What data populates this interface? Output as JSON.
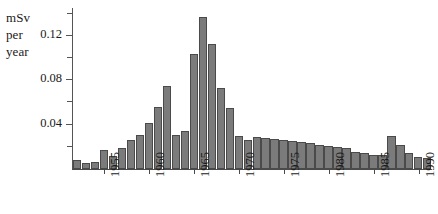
{
  "chart_data": {
    "type": "bar",
    "title": "",
    "subtitle": "",
    "xlabel": "",
    "ylabel": "mSv per year",
    "ylabel_lines": [
      "mSv",
      "per",
      "year"
    ],
    "ylim": [
      0,
      0.145
    ],
    "xlim": [
      1951.5,
      1991.5
    ],
    "grid": false,
    "legend": null,
    "bar_color": "#7b7b7b",
    "bar_edge_color": "#4a4a4a",
    "axis_color": "#4a4a4a",
    "y_ticks_major": [
      0.04,
      0.08,
      0.12
    ],
    "y_tick_labels": [
      "0.04",
      "0.08",
      "0.12"
    ],
    "y_ticks_minor": [
      0.02,
      0.06,
      0.1,
      0.14
    ],
    "x_ticks": [
      1955,
      1960,
      1965,
      1970,
      1975,
      1980,
      1985,
      1990
    ],
    "x_tick_labels": [
      "1955",
      "1960",
      "1965",
      "1970",
      "1975",
      "1980",
      "1985",
      "1990"
    ],
    "categories": [
      1952,
      1953,
      1954,
      1955,
      1956,
      1957,
      1958,
      1959,
      1960,
      1961,
      1962,
      1963,
      1964,
      1965,
      1966,
      1967,
      1968,
      1969,
      1970,
      1971,
      1972,
      1973,
      1974,
      1975,
      1976,
      1977,
      1978,
      1979,
      1980,
      1981,
      1982,
      1983,
      1984,
      1985,
      1986,
      1987,
      1988,
      1989,
      1990,
      1991
    ],
    "values": [
      0.008,
      0.005,
      0.006,
      0.017,
      0.012,
      0.019,
      0.026,
      0.031,
      0.041,
      0.056,
      0.075,
      0.031,
      0.034,
      0.104,
      0.137,
      0.113,
      0.073,
      0.055,
      0.03,
      0.026,
      0.029,
      0.028,
      0.027,
      0.026,
      0.025,
      0.024,
      0.023,
      0.022,
      0.021,
      0.02,
      0.019,
      0.015,
      0.014,
      0.013,
      0.013,
      0.03,
      0.022,
      0.014,
      0.011,
      0.01
    ]
  }
}
